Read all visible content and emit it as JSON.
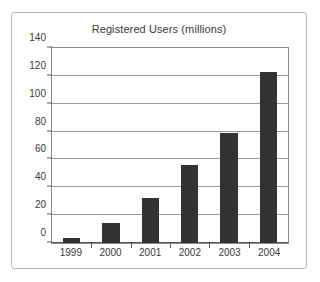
{
  "chart_data": {
    "type": "bar",
    "title": "Registered Users (millions)",
    "xlabel": "",
    "ylabel": "",
    "categories": [
      "1999",
      "2000",
      "2001",
      "2002",
      "2003",
      "2004"
    ],
    "values": [
      3.5,
      14.5,
      32,
      56,
      79,
      123
    ],
    "series": [
      {
        "name": "Registered Users (millions)",
        "values": [
          3.5,
          14.5,
          32,
          56,
          79,
          123
        ]
      }
    ],
    "ylim": [
      0,
      140
    ],
    "yticks": [
      0,
      20,
      40,
      60,
      80,
      100,
      120,
      140
    ],
    "ytick_labels": [
      "0",
      "20",
      "40",
      "60",
      "80",
      "100",
      "120",
      "140"
    ],
    "grid": true,
    "legend": false,
    "legend_position": "none",
    "bar_color": "#333333",
    "gridline_color": "#9a9a9a",
    "axis_color": "#555555",
    "frame_color": "#b9b9b9",
    "text_color": "#3a3a3a"
  }
}
